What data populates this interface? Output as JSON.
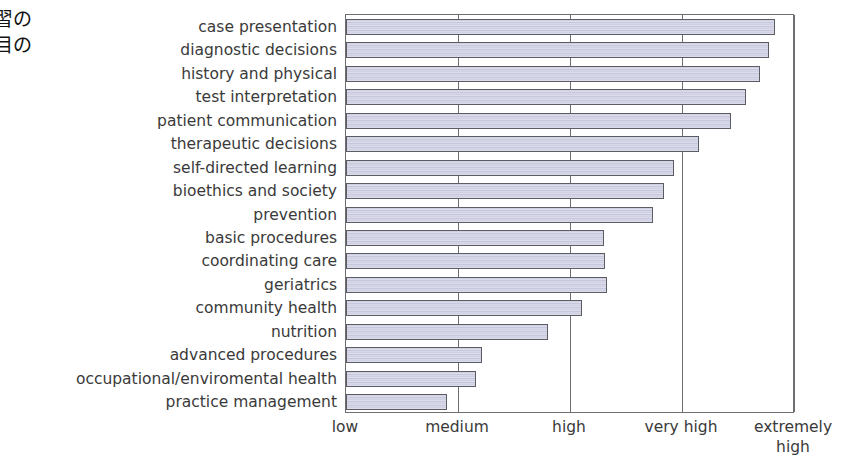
{
  "caption": {
    "line1": "習の",
    "line2": "目の"
  },
  "chart_data": {
    "type": "bar",
    "orientation": "horizontal",
    "title": "",
    "xlabel": "",
    "ylabel": "",
    "grid": true,
    "legend": null,
    "xticklabels": [
      "low",
      "medium",
      "high",
      "very high",
      "extremely high"
    ],
    "xtick_values": [
      1,
      2,
      3,
      4,
      5
    ],
    "xlim": [
      1,
      5
    ],
    "categories": [
      "case presentation",
      "diagnostic decisions",
      "history and physical",
      "test interpretation",
      "patient communication",
      "therapeutic decisions",
      "self-directed learning",
      "bioethics and society",
      "prevention",
      "basic procedures",
      "coordinating care",
      "geriatrics",
      "community health",
      "nutrition",
      "advanced procedures",
      "occupational/enviromental health",
      "practice management"
    ],
    "values": [
      4.83,
      4.78,
      4.7,
      4.57,
      4.44,
      4.15,
      3.93,
      3.84,
      3.74,
      3.3,
      3.31,
      3.33,
      3.11,
      2.8,
      2.21,
      2.16,
      1.9
    ]
  }
}
